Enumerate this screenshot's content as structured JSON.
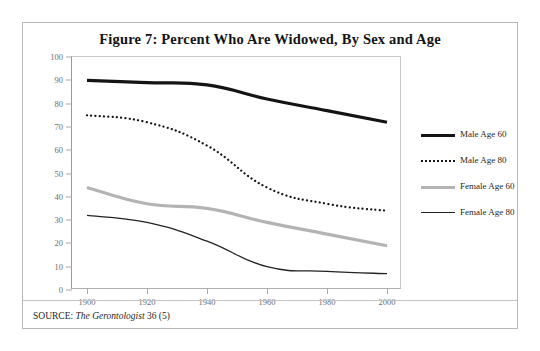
{
  "figure": {
    "title": "Figure 7: Percent Who Are Widowed, By Sex and Age",
    "source_prefix": "SOURCE: ",
    "source_italic": "The Gerontologist",
    "source_suffix": " 36 (5)"
  },
  "legend": {
    "items": [
      {
        "label": "Male Age 60",
        "style": "solid-thick",
        "color": "#141414"
      },
      {
        "label": "Male Age 80",
        "style": "dotted",
        "color": "#141414"
      },
      {
        "label": "Female Age 60",
        "style": "solid-thick",
        "color": "#b3b3b3"
      },
      {
        "label": "Female Age 80",
        "style": "solid-thin",
        "color": "#232323"
      }
    ]
  },
  "chart_data": {
    "type": "line",
    "title": "Figure 7: Percent Who Are Widowed, By Sex and Age",
    "xlabel": "",
    "ylabel": "",
    "x": [
      1900,
      1920,
      1940,
      1960,
      1980,
      2000
    ],
    "xlim": [
      1895,
      2005
    ],
    "ylim": [
      0,
      100
    ],
    "xticks": [
      1900,
      1920,
      1940,
      1960,
      1980,
      2000
    ],
    "yticks": [
      0,
      10,
      20,
      30,
      40,
      50,
      60,
      70,
      80,
      90,
      100
    ],
    "grid": false,
    "legend_position": "right-outside",
    "series": [
      {
        "name": "Male Age 60",
        "values": [
          90,
          89,
          88,
          82,
          77,
          72
        ],
        "color": "#141414",
        "style": "solid",
        "width": 3.2
      },
      {
        "name": "Male Age 80",
        "values": [
          75,
          72,
          62,
          44,
          37,
          34
        ],
        "color": "#141414",
        "style": "dotted",
        "width": 2.2
      },
      {
        "name": "Female Age 60",
        "values": [
          44,
          37,
          35,
          29,
          24,
          19
        ],
        "color": "#b3b3b3",
        "style": "solid",
        "width": 3.2
      },
      {
        "name": "Female Age 80",
        "values": [
          32,
          29,
          21,
          10,
          8,
          7
        ],
        "color": "#232323",
        "style": "solid",
        "width": 1.3
      }
    ]
  }
}
